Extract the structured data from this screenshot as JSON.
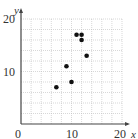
{
  "chart_data": {
    "type": "scatter",
    "title": "",
    "xlabel": "x",
    "ylabel": "y",
    "xlim": [
      0,
      20
    ],
    "ylim": [
      0,
      20
    ],
    "grid": true,
    "x_ticks": [
      "0",
      "10",
      "20"
    ],
    "y_ticks": [
      "10",
      "20"
    ],
    "points": [
      {
        "x": 7,
        "y": 7
      },
      {
        "x": 9,
        "y": 11
      },
      {
        "x": 10,
        "y": 8
      },
      {
        "x": 11,
        "y": 17
      },
      {
        "x": 12,
        "y": 17
      },
      {
        "x": 12,
        "y": 16
      },
      {
        "x": 13,
        "y": 13
      }
    ],
    "colors": {
      "points": "#111111",
      "axis": "#444444",
      "grid": "#bdbdbd"
    }
  }
}
